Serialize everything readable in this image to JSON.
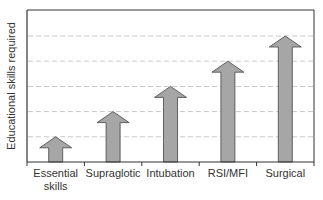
{
  "chart_data": {
    "type": "bar",
    "subtype": "arrow-bars",
    "title": "",
    "xlabel": "",
    "ylabel": "Educational skills required",
    "categories": [
      "Essential skills",
      "Supraglotic",
      "Intubation",
      "RSI/MFI",
      "Surgical"
    ],
    "category_lines": [
      [
        "Essential",
        "skills"
      ],
      [
        "Supraglotic"
      ],
      [
        "Intubation"
      ],
      [
        "RSI/MFI"
      ],
      [
        "Surgical"
      ]
    ],
    "values": [
      1,
      2,
      3,
      4,
      5
    ],
    "ylim": [
      0,
      6
    ],
    "grid": {
      "y": true,
      "style": "dashed",
      "levels": [
        1,
        2,
        3,
        4,
        5
      ]
    },
    "y_tick_labels_shown": false,
    "legend": null
  },
  "colors": {
    "arrow_fill": "#a6a6a6",
    "arrow_stroke": "#444444",
    "axis": "#333333",
    "grid": "#c8c8c8"
  },
  "labels": {
    "ylabel": "Educational skills required"
  }
}
